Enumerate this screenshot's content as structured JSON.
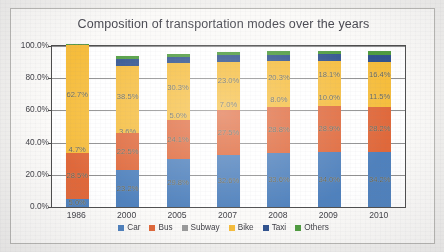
{
  "chart_data": {
    "type": "bar",
    "stacked": true,
    "title": "Composition of transportation modes over the years",
    "xlabel": "",
    "ylabel": "",
    "ylim": [
      0,
      100
    ],
    "ytick_labels": [
      "0.0%",
      "20.0%",
      "40.0%",
      "60.0%",
      "80.0%",
      "100.0%"
    ],
    "ytick_values": [
      0,
      20,
      40,
      60,
      80,
      100
    ],
    "grid": true,
    "legend_position": "bottom",
    "categories": [
      "1986",
      "2000",
      "2005",
      "2007",
      "2008",
      "2009",
      "2010"
    ],
    "series": [
      {
        "name": "Car",
        "color": "#4f81bd",
        "values": [
          5.0,
          23.2,
          29.8,
          32.6,
          33.6,
          34.0,
          34.2
        ],
        "labels": [
          "5.0%",
          "23.2%",
          "29.8%",
          "32.6%",
          "33.6%",
          "34.0%",
          "34.2%"
        ]
      },
      {
        "name": "Bus",
        "color": "#e0683a",
        "values": [
          28.5,
          22.5,
          24.1,
          27.5,
          28.8,
          28.9,
          28.2
        ],
        "labels": [
          "28.5%",
          "22.5%",
          "24.1%",
          "27.5%",
          "28.8%",
          "28.9%",
          "28.2%"
        ]
      },
      {
        "name": "Subway",
        "color": "#9a9a9a",
        "values": [
          0.0,
          0.0,
          0.0,
          0.0,
          0.0,
          0.0,
          0.0
        ],
        "labels": [
          "",
          "",
          "",
          "",
          "",
          "",
          ""
        ]
      },
      {
        "name": "Bike",
        "color": "#f6bd3c",
        "values": [
          67.4,
          42.1,
          35.3,
          30.0,
          28.3,
          28.1,
          27.9
        ],
        "labels": [
          "",
          "",
          "",
          "",
          "",
          "",
          ""
        ]
      },
      {
        "name": "Taxi",
        "color": "#31538f",
        "values": [
          0.0,
          4.2,
          4.1,
          4.1,
          3.8,
          4.0,
          4.3
        ],
        "labels": [
          "",
          "",
          "",
          "",
          "",
          "",
          ""
        ]
      },
      {
        "name": "Others",
        "color": "#4f9c3f",
        "values": [
          0.5,
          2.0,
          1.9,
          2.1,
          2.2,
          2.0,
          2.1
        ],
        "labels": [
          "0.5%",
          "",
          "",
          "",
          "",
          "",
          ""
        ]
      }
    ],
    "bike_split_labels": {
      "upper": [
        "62.7%",
        "38.5%",
        "30.3%",
        "23.0%",
        "20.3%",
        "18.1%",
        "16.4%"
      ],
      "lower": [
        "4.7%",
        "3.6%",
        "5.0%",
        "7.0%",
        "8.0%",
        "10.0%",
        "11.5%"
      ]
    },
    "annotations": [
      "1986 Bike 62.7% and 4.7%",
      "2000 Bike 38.5% and 3.6%",
      "2005 Bike 30.3% and 5.0%",
      "2007 Bike 23.0% and 7.0%",
      "2008 Bike 20.3% and 8.0%",
      "2009 Bike 18.1% and 10.0%",
      "2010 Bike 16.4% and 11.5%"
    ]
  },
  "legend": {
    "items": [
      {
        "label": "Car",
        "color": "#4f81bd"
      },
      {
        "label": "Bus",
        "color": "#e0683a"
      },
      {
        "label": "Subway",
        "color": "#9a9a9a"
      },
      {
        "label": "Bike",
        "color": "#f6bd3c"
      },
      {
        "label": "Taxi",
        "color": "#31538f"
      },
      {
        "label": "Others",
        "color": "#4f9c3f"
      }
    ]
  }
}
